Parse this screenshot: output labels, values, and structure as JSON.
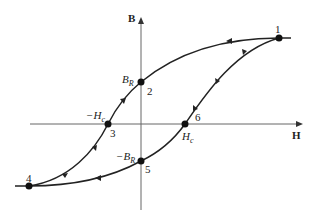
{
  "diagram": {
    "type": "hysteresis-loop",
    "axes": {
      "x_label": "H",
      "y_label": "B"
    },
    "points": [
      {
        "id": "1",
        "label": "1",
        "x": 279,
        "y": 38
      },
      {
        "id": "2",
        "label": "2",
        "x": 141,
        "y": 82,
        "annotation": "B_R"
      },
      {
        "id": "3",
        "label": "3",
        "x": 108,
        "y": 124,
        "annotation": "-H_c"
      },
      {
        "id": "4",
        "label": "4",
        "x": 29,
        "y": 186
      },
      {
        "id": "5",
        "label": "5",
        "x": 141,
        "y": 161,
        "annotation": "-B_R"
      },
      {
        "id": "6",
        "label": "6",
        "x": 185,
        "y": 124,
        "annotation": "H_c"
      }
    ],
    "annotations": {
      "br": "B",
      "br_sub": "R",
      "neg_br": "−B",
      "neg_br_sub": "R",
      "hc": "H",
      "hc_sub": "c",
      "neg_hc": "−H",
      "neg_hc_sub": "c"
    },
    "colors": {
      "curve": "#222222",
      "axis": "#555555"
    }
  }
}
